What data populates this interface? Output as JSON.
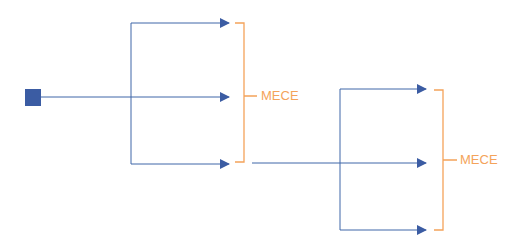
{
  "diagram": {
    "title": "",
    "colors": {
      "line": "#3f67a8",
      "node": "#3b5ca3",
      "bracket": "#f4a35a"
    },
    "groups": [
      {
        "label": "MECE",
        "branches": 3
      },
      {
        "label": "MECE",
        "branches": 3
      }
    ]
  }
}
